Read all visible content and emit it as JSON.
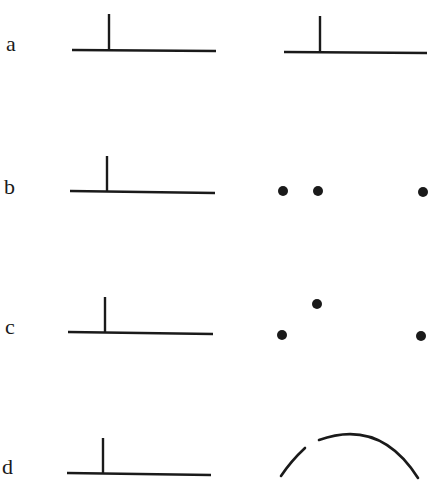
{
  "colors": {
    "ink": "#1a1a1a",
    "background": "#ffffff"
  },
  "rows": [
    {
      "label": "a",
      "label_pos": {
        "x": 6,
        "y": 33
      },
      "left": {
        "type": "t-shape",
        "h": {
          "x1": 72,
          "y1": 50,
          "x2": 216,
          "y2": 51
        },
        "v": {
          "x": 109,
          "y1": 14,
          "y2": 50
        }
      },
      "right": {
        "type": "t-shape",
        "h": {
          "x1": 284,
          "y1": 52,
          "x2": 427,
          "y2": 53
        },
        "v": {
          "x": 320,
          "y1": 16,
          "y2": 52
        }
      }
    },
    {
      "label": "b",
      "label_pos": {
        "x": 4,
        "y": 176
      },
      "left": {
        "type": "t-shape",
        "h": {
          "x1": 70,
          "y1": 191,
          "x2": 215,
          "y2": 193
        },
        "v": {
          "x": 107,
          "y1": 156,
          "y2": 191
        }
      },
      "right": {
        "type": "dots",
        "points": [
          {
            "x": 283,
            "y": 191
          },
          {
            "x": 318,
            "y": 191
          },
          {
            "x": 423,
            "y": 192
          }
        ],
        "r": 5
      }
    },
    {
      "label": "c",
      "label_pos": {
        "x": 5,
        "y": 316
      },
      "left": {
        "type": "t-shape",
        "h": {
          "x1": 68,
          "y1": 332,
          "x2": 213,
          "y2": 334
        },
        "v": {
          "x": 105,
          "y1": 297,
          "y2": 332
        }
      },
      "right": {
        "type": "dots",
        "points": [
          {
            "x": 282,
            "y": 335
          },
          {
            "x": 317,
            "y": 304
          },
          {
            "x": 421,
            "y": 336
          }
        ],
        "r": 5
      }
    },
    {
      "label": "d",
      "label_pos": {
        "x": 2,
        "y": 456
      },
      "left": {
        "type": "t-shape",
        "h": {
          "x1": 67,
          "y1": 473,
          "x2": 211,
          "y2": 475
        },
        "v": {
          "x": 103,
          "y1": 438,
          "y2": 473
        }
      },
      "right": {
        "type": "broken-arc",
        "segments": [
          "M 281 476 Q 291 461 305 448",
          "M 319 440 Q 380 418 418 478"
        ]
      }
    }
  ]
}
